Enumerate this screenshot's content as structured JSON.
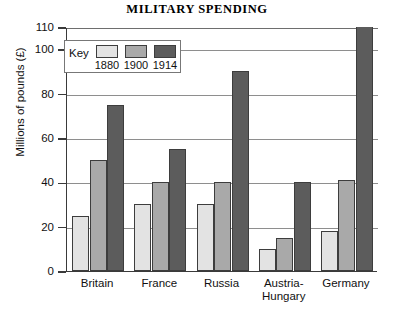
{
  "chart_data": {
    "type": "bar",
    "title": "MILITARY SPENDING",
    "xlabel": "",
    "ylabel": "Millions of pounds (£)",
    "ylim": [
      0,
      110
    ],
    "yticks": [
      0,
      20,
      40,
      60,
      80,
      100,
      110
    ],
    "grid": true,
    "legend_position": "inside-top-left",
    "legend_title": "Key",
    "categories": [
      "Britain",
      "France",
      "Russia",
      "Austria-\nHungary",
      "Germany"
    ],
    "series": [
      {
        "name": "1880",
        "color": "#e3e3e3",
        "values": [
          25,
          30,
          30,
          10,
          18
        ]
      },
      {
        "name": "1900",
        "color": "#a9a9a9",
        "values": [
          50,
          40,
          40,
          15,
          41
        ]
      },
      {
        "name": "1914",
        "color": "#5c5c5c",
        "values": [
          75,
          55,
          90,
          40,
          115
        ]
      }
    ]
  },
  "axis": {
    "y_tick_labels": [
      "110",
      "100",
      "80",
      "60",
      "40",
      "20",
      "0"
    ],
    "y_title": "Millions of pounds (£)"
  },
  "legend": {
    "key_label": "Key",
    "entries": [
      {
        "year": "1880",
        "color": "#e3e3e3"
      },
      {
        "year": "1900",
        "color": "#a9a9a9"
      },
      {
        "year": "1914",
        "color": "#5c5c5c"
      }
    ]
  },
  "x_labels": [
    "Britain",
    "France",
    "Russia",
    "Austria-\nHungary",
    "Germany"
  ]
}
